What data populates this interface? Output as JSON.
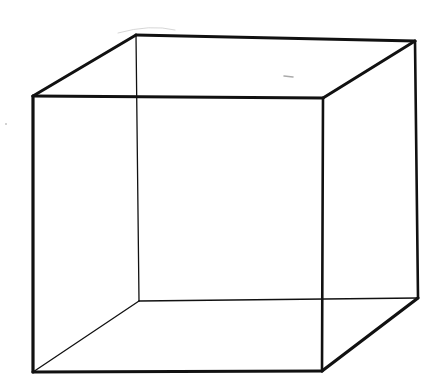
{
  "figure": {
    "stroke_color": "#111111",
    "background": "#ffffff",
    "vertices": {
      "front_top_left": [
        33,
        96
      ],
      "front_top_right": [
        323,
        98
      ],
      "front_bottom_left": [
        33,
        372
      ],
      "front_bottom_right": [
        322,
        371
      ],
      "back_top_left": [
        136,
        35
      ],
      "back_top_right": [
        415,
        41
      ],
      "back_bottom_left": [
        139,
        301
      ],
      "back_bottom_right": [
        418,
        298
      ]
    }
  }
}
